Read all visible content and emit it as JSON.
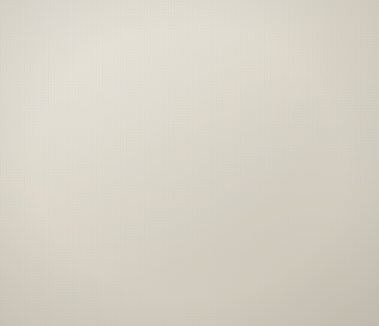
{
  "figure": {
    "title": "",
    "background_color": "#efece5",
    "ink_color": "#111111",
    "width": 379,
    "height": 326
  },
  "chart_data": {
    "type": "bar",
    "orientation": "horizontal",
    "title": "",
    "subtitle": "",
    "xlabel": "",
    "ylabel": "",
    "grid": true,
    "grid_orientation": "vertical",
    "legend": null,
    "legend_position": "none",
    "xlim": [
      0,
      16
    ],
    "x_gridline_values": [
      0,
      1,
      2,
      3,
      4,
      5,
      6,
      7,
      8,
      9,
      10,
      11,
      12,
      13,
      14,
      15,
      16
    ],
    "x_tick_labels": [
      "",
      "",
      "",
      "",
      "",
      "",
      "",
      "",
      "",
      "",
      "",
      "",
      "",
      "",
      "",
      "",
      ""
    ],
    "categories": [
      "r1",
      "r2",
      "r3",
      "r4",
      "r5",
      "r6",
      "r7",
      "r8",
      "r9",
      "r10",
      "r11",
      "r12",
      "r13",
      "r14",
      "m1",
      "m2",
      "m3",
      "m4",
      "m5"
    ],
    "values": [
      7.8,
      7.9,
      0.4,
      0,
      0,
      0,
      0,
      0,
      0,
      0,
      0,
      0,
      0,
      0,
      0,
      0,
      0,
      0,
      0
    ],
    "bars": [
      {
        "id": "bar-1",
        "group": "top",
        "y": 14,
        "height": 9,
        "x_end": 190,
        "value": 7.8,
        "label": ""
      },
      {
        "id": "bar-2",
        "group": "top",
        "y": 29,
        "height": 9,
        "x_end": 192,
        "value": 7.9,
        "label": ""
      },
      {
        "id": "bar-3",
        "group": "top",
        "y": 44,
        "height": 9,
        "x_end": 29,
        "value": 0.45,
        "label": ""
      },
      {
        "id": "bar-4",
        "group": "middle",
        "y": 119,
        "height": 9,
        "x_end": 88,
        "value": 3.1,
        "label": ""
      },
      {
        "id": "bar-5",
        "group": "middle",
        "y": 133,
        "height": 9,
        "x_end": 132,
        "value": 5.1,
        "label": ""
      },
      {
        "id": "bar-6",
        "group": "middle",
        "y": 147,
        "height": 9,
        "x_end": 101,
        "value": 3.7,
        "label": ""
      },
      {
        "id": "bar-7",
        "group": "middle",
        "y": 161,
        "height": 9,
        "x_end": 79,
        "value": 2.7,
        "label": ""
      },
      {
        "id": "bar-8",
        "group": "middle",
        "y": 175,
        "height": 9,
        "x_end": 110,
        "value": 4.1,
        "label": ""
      },
      {
        "id": "bar-9",
        "group": "middle",
        "y": 189,
        "height": 9,
        "x_end": 78,
        "value": 2.7,
        "label": ""
      },
      {
        "id": "bar-10",
        "group": "middle",
        "y": 203,
        "height": 9,
        "x_end": 79,
        "value": 2.7,
        "label": ""
      },
      {
        "id": "bar-11",
        "group": "middle",
        "y": 217,
        "height": 9,
        "x_end": 122,
        "value": 4.7,
        "label": ""
      },
      {
        "id": "bar-12",
        "group": "middle",
        "y": 231,
        "height": 9,
        "x_end": 130,
        "value": 5.0,
        "label": ""
      }
    ],
    "markers": [
      {
        "id": "marker-1",
        "cy": 250,
        "cx": 22,
        "shape": "diamond"
      },
      {
        "id": "marker-2",
        "cy": 266,
        "cx": 22,
        "shape": "diamond"
      },
      {
        "id": "marker-3",
        "cy": 282,
        "cx": 22,
        "shape": "diamond"
      },
      {
        "id": "marker-4",
        "cy": 296,
        "cx": 22,
        "shape": "diamond"
      },
      {
        "id": "marker-5",
        "cy": 311,
        "cx": 22,
        "shape": "diamond"
      }
    ],
    "gridlines": [
      {
        "id": "grid-0",
        "x": 19,
        "is_axis": true
      },
      {
        "id": "grid-1",
        "x": 41,
        "is_axis": false
      },
      {
        "id": "grid-2",
        "x": 62,
        "is_axis": false
      },
      {
        "id": "grid-3",
        "x": 83,
        "is_axis": false
      },
      {
        "id": "grid-4",
        "x": 104,
        "is_axis": false
      },
      {
        "id": "grid-5",
        "x": 125,
        "is_axis": false
      },
      {
        "id": "grid-6",
        "x": 146,
        "is_axis": false
      },
      {
        "id": "grid-7",
        "x": 167,
        "is_axis": false
      },
      {
        "id": "grid-8",
        "x": 188,
        "is_axis": false
      },
      {
        "id": "grid-9",
        "x": 210,
        "is_axis": false
      },
      {
        "id": "grid-10",
        "x": 231,
        "is_axis": false
      },
      {
        "id": "grid-11",
        "x": 252,
        "is_axis": false
      },
      {
        "id": "grid-12",
        "x": 273,
        "is_axis": false
      },
      {
        "id": "grid-13",
        "x": 294,
        "is_axis": false
      },
      {
        "id": "grid-14",
        "x": 315,
        "is_axis": false
      },
      {
        "id": "grid-15",
        "x": 336,
        "is_axis": false
      },
      {
        "id": "grid-16",
        "x": 357,
        "is_axis": false
      }
    ],
    "plot_top": 12,
    "plot_bottom": 318
  }
}
